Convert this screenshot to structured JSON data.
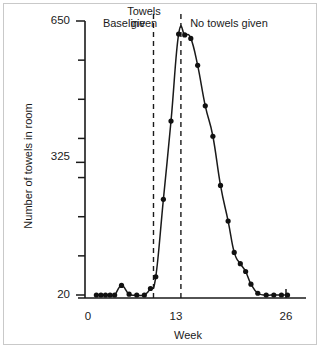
{
  "figure": {
    "background": "#ffffff",
    "frame_color": "#c9c9c9",
    "ink_color": "#1a1a1a"
  },
  "axis": {
    "y_label": "Number of towels in room",
    "x_label": "Week",
    "y_ticks_labeled": [
      "650",
      "325",
      "20"
    ],
    "x_ticks_labeled": [
      "0",
      "13",
      "26"
    ]
  },
  "phases": [
    {
      "name": "baseline",
      "label": "Baseline",
      "lines": [
        "Baseline"
      ]
    },
    {
      "name": "towels-given",
      "label": "Towels given",
      "lines": [
        "Towels",
        "given"
      ]
    },
    {
      "name": "no-towels-given",
      "label": "No towels given",
      "lines": [
        "No towels given"
      ]
    }
  ],
  "phase_dividers": [
    {
      "name": "divider-baseline-to-towels",
      "week": 8.6
    },
    {
      "name": "divider-towels-to-no-towels",
      "week": 12.2
    }
  ],
  "chart_data": {
    "type": "line",
    "title": "",
    "subtitle": "",
    "xlabel": "Week",
    "ylabel": "Number of towels in room",
    "xlim": [
      0,
      27
    ],
    "ylim": [
      20,
      650
    ],
    "grid": false,
    "legend": null,
    "annotations": [
      {
        "text": "Baseline",
        "x": 4.3,
        "y": 650,
        "name": "phase-label-baseline"
      },
      {
        "text": "Towels given",
        "x": 10.4,
        "y": 650,
        "name": "phase-label-towels-given"
      },
      {
        "text": "No towels given",
        "x": 19.5,
        "y": 650,
        "name": "phase-label-no-towels-given"
      }
    ],
    "vlines": [
      8.6,
      12.2
    ],
    "y_tick_values": [
      20,
      110,
      200,
      290,
      325,
      380,
      470,
      560,
      650
    ],
    "y_tick_labels": {
      "20": "20",
      "325": "325",
      "650": "650"
    },
    "x_tick_values": [
      0,
      13,
      26
    ],
    "x_tick_labels": {
      "0": "0",
      "13": "13",
      "26": "26"
    },
    "series": [
      {
        "name": "towels in room",
        "marker": "filled-circle",
        "line": "solid",
        "x": [
          1.1,
          1.7,
          2.3,
          2.9,
          3.5,
          4.4,
          5.4,
          6.4,
          7.4,
          8.2,
          8.9,
          9.9,
          10.9,
          11.9,
          12.7,
          13.5,
          14.4,
          15.4,
          16.4,
          17.4,
          18.4,
          19.2,
          20.0,
          20.7,
          21.4,
          22.3,
          23.4,
          24.4,
          25.4,
          26.2
        ],
        "y": [
          20,
          20,
          20,
          20,
          20,
          42,
          22,
          20,
          20,
          35,
          62,
          240,
          420,
          620,
          618,
          610,
          548,
          455,
          385,
          272,
          190,
          118,
          92,
          74,
          45,
          24,
          20,
          20,
          20,
          20
        ]
      }
    ]
  }
}
